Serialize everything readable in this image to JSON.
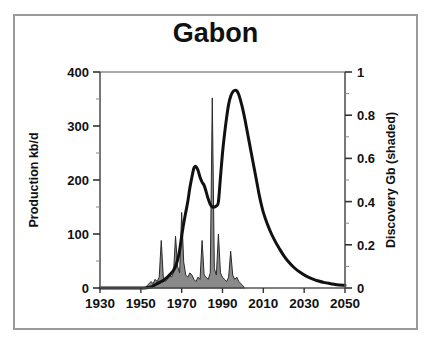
{
  "figure": {
    "title": "Gabon",
    "border_color": "#9a9a9a",
    "background": "#ffffff"
  },
  "chart_data": {
    "type": "area",
    "title": "Gabon",
    "xlabel": "",
    "xlim": [
      1930,
      2050
    ],
    "xticks": [
      1930,
      1950,
      1970,
      1990,
      2010,
      2030,
      2050
    ],
    "xticklabels": [
      "1930",
      "1950",
      "1970",
      "1990",
      "2010",
      "2030",
      "2050"
    ],
    "grid": false,
    "legend": "none",
    "axes": [
      {
        "side": "left",
        "label": "Production kb/d",
        "ylim": [
          0,
          400
        ],
        "yticks": [
          0,
          100,
          200,
          300,
          400
        ],
        "yticklabels": [
          "0",
          "100",
          "200",
          "300",
          "400"
        ],
        "minor_tick_step": 50
      },
      {
        "side": "right",
        "label": "Discovery Gb (shaded)",
        "ylim": [
          0,
          1
        ],
        "yticks": [
          0,
          0.2,
          0.4,
          0.6,
          0.8,
          1
        ],
        "yticklabels": [
          "0",
          "0.2",
          "0.4",
          "0.6",
          "0.8",
          "1"
        ],
        "minor_tick_step": 0.1
      }
    ],
    "series": [
      {
        "name": "Production kb/d",
        "axis": "left",
        "style": "line",
        "color": "#111111",
        "linewidth": 3,
        "x": [
          1930,
          1950,
          1955,
          1956,
          1957,
          1958,
          1959,
          1960,
          1961,
          1962,
          1963,
          1964,
          1965,
          1966,
          1967,
          1968,
          1969,
          1970,
          1971,
          1972,
          1973,
          1974,
          1975,
          1976,
          1977,
          1978,
          1979,
          1980,
          1981,
          1982,
          1983,
          1984,
          1985,
          1986,
          1987,
          1988,
          1989,
          1990,
          1991,
          1992,
          1993,
          1994,
          1995,
          1996,
          1997,
          1998,
          1999,
          2000,
          2001,
          2002,
          2003,
          2004,
          2005,
          2006,
          2007,
          2008,
          2009,
          2010,
          2012,
          2014,
          2016,
          2018,
          2020,
          2022,
          2025,
          2028,
          2031,
          2034,
          2037,
          2040,
          2043,
          2046,
          2050
        ],
        "y": [
          0,
          0,
          2,
          4,
          6,
          8,
          10,
          12,
          14,
          17,
          20,
          24,
          28,
          33,
          40,
          52,
          70,
          96,
          120,
          140,
          160,
          185,
          205,
          222,
          225,
          218,
          205,
          196,
          190,
          178,
          165,
          155,
          150,
          150,
          152,
          160,
          205,
          250,
          285,
          315,
          340,
          355,
          363,
          366,
          365,
          358,
          345,
          330,
          312,
          292,
          272,
          252,
          232,
          212,
          192,
          172,
          155,
          140,
          118,
          100,
          85,
          72,
          60,
          50,
          38,
          29,
          22,
          17,
          13,
          10,
          8,
          6,
          5
        ]
      },
      {
        "name": "Discovery Gb",
        "axis": "right",
        "style": "filled-spikes",
        "fill_color": "#8a8a8a",
        "edge_color": "#2a2a2a",
        "x": [
          1952,
          1953,
          1954,
          1955,
          1956,
          1957,
          1958,
          1959,
          1960,
          1961,
          1962,
          1963,
          1964,
          1965,
          1966,
          1967,
          1968,
          1969,
          1970,
          1971,
          1972,
          1973,
          1974,
          1975,
          1976,
          1977,
          1978,
          1979,
          1980,
          1981,
          1982,
          1983,
          1984,
          1985,
          1986,
          1987,
          1988,
          1989,
          1990,
          1991,
          1992,
          1993,
          1994,
          1995,
          1996,
          1997,
          1998,
          1999,
          2000,
          2001
        ],
        "y": [
          0,
          0.01,
          0.02,
          0.03,
          0.02,
          0.04,
          0.03,
          0.05,
          0.22,
          0.05,
          0.03,
          0.04,
          0.06,
          0.05,
          0.07,
          0.24,
          0.1,
          0.07,
          0.35,
          0.12,
          0.06,
          0.05,
          0.07,
          0.06,
          0.04,
          0.03,
          0.05,
          0.04,
          0.22,
          0.06,
          0.05,
          0.04,
          0.07,
          0.88,
          0.09,
          0.06,
          0.25,
          0.07,
          0.05,
          0.04,
          0.03,
          0.05,
          0.17,
          0.06,
          0.04,
          0.05,
          0.03,
          0.02,
          0.01,
          0.0
        ]
      }
    ]
  }
}
